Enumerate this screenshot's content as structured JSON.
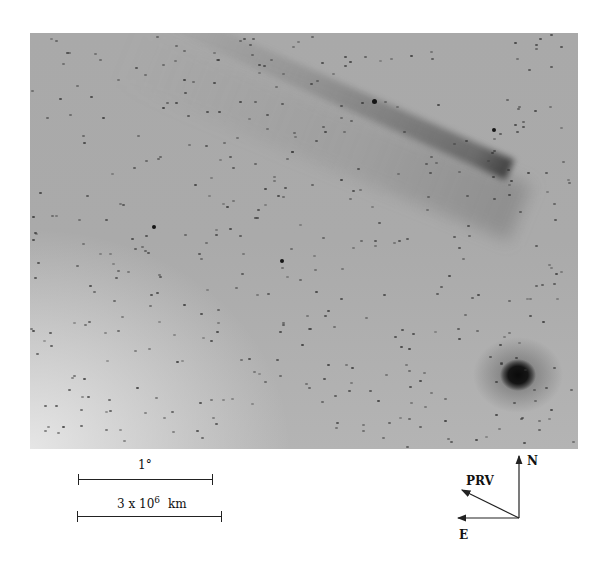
{
  "figure": {
    "scale_bars": [
      {
        "label": "1°",
        "length_px": 135
      },
      {
        "label_base": "3 x 10",
        "label_exp": "6",
        "label_unit": "km",
        "length_px": 145
      }
    ],
    "compass": {
      "north_label": "N",
      "east_label": "E",
      "prv_label": "PRV"
    }
  },
  "colors": {
    "background": "#ffffff",
    "sky": "#aaaaaa",
    "nucleus": "#0a0a0a",
    "ink": "#222222"
  }
}
